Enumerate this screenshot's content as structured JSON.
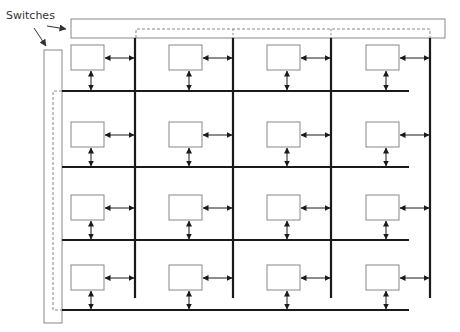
{
  "diagram": {
    "label": "Switches",
    "label_pos": {
      "x": 6,
      "y": 9
    },
    "colors": {
      "bus": "#1a1a1a",
      "box": "#888888",
      "switch_bar": "#888888",
      "dashed": "#888888",
      "arrow": "#1a1a1a",
      "label_arrow": "#333333"
    },
    "top_switch": {
      "x": 71,
      "y": 19,
      "w": 374,
      "h": 19,
      "dashed_y": 29,
      "dashed_x1": 136,
      "dashed_x2": 430
    },
    "left_switch": {
      "x": 44,
      "y": 50,
      "w": 18,
      "h": 273,
      "dashed_x": 53,
      "dashed_y1": 91,
      "dashed_y2": 310
    },
    "vertical_buses": [
      {
        "x": 135,
        "y1": 38,
        "y2": 298
      },
      {
        "x": 233,
        "y1": 38,
        "y2": 298
      },
      {
        "x": 331,
        "y1": 38,
        "y2": 298
      },
      {
        "x": 430,
        "y1": 38,
        "y2": 298
      }
    ],
    "horizontal_buses": [
      {
        "y": 91,
        "x1": 62,
        "x2": 409
      },
      {
        "y": 167,
        "x1": 62,
        "x2": 409
      },
      {
        "y": 240,
        "x1": 62,
        "x2": 409
      },
      {
        "y": 310,
        "x1": 62,
        "x2": 409
      }
    ],
    "rows": [
      {
        "box_y": 45,
        "box_h": 25,
        "h_arrow_y": 58,
        "bus_y": 91
      },
      {
        "box_y": 122,
        "box_h": 25,
        "h_arrow_y": 135,
        "bus_y": 167
      },
      {
        "box_y": 195,
        "box_h": 25,
        "h_arrow_y": 208,
        "bus_y": 240
      },
      {
        "box_y": 265,
        "box_h": 25,
        "h_arrow_y": 278,
        "bus_y": 310
      }
    ],
    "columns": [
      {
        "box_x": 71,
        "box_w": 33,
        "vbus_x": 135
      },
      {
        "box_x": 169,
        "box_w": 33,
        "vbus_x": 233
      },
      {
        "box_x": 267,
        "box_w": 33,
        "vbus_x": 331
      },
      {
        "box_x": 366,
        "box_w": 33,
        "vbus_x": 430
      }
    ],
    "label_arrows": [
      {
        "from": {
          "x": 47,
          "y": 26
        },
        "to": {
          "x": 66,
          "y": 29
        },
        "target": "top-switch"
      },
      {
        "from": {
          "x": 34,
          "y": 28
        },
        "to": {
          "x": 46,
          "y": 46
        },
        "target": "left-switch"
      }
    ]
  }
}
